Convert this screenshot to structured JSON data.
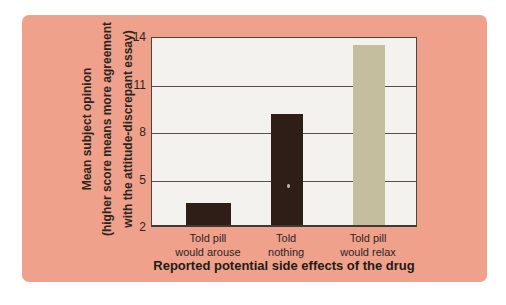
{
  "colors": {
    "panel_bg": "#f0a18c",
    "plot_bg": "#f3f2ee",
    "axis_line": "#49443e",
    "text": "#2b2520",
    "bar_dark_maroon": "#2f1d18",
    "bar_tan": "#c4bd9e"
  },
  "chart_data": {
    "type": "bar",
    "categories": [
      "Told pill\nwould arouse",
      "Told\nnothing",
      "Told pill\nwould relax"
    ],
    "values": [
      3.4,
      9.0,
      13.4
    ],
    "bar_colors": [
      "#2f1d18",
      "#2f1d18",
      "#c4bd9e"
    ],
    "xlabel": "Reported potential side effects of the drug",
    "ylabel": "Mean subject opinion\n(higher score means more agreement\nwith the attitude-discrepant essay)",
    "ylim": [
      2,
      14
    ],
    "yticks": [
      14,
      11,
      8,
      5,
      2
    ],
    "grid": true,
    "legend_position": "none"
  }
}
